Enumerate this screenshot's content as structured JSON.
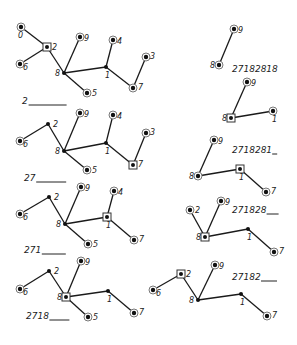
{
  "figure": {
    "graphs": [
      {
        "id": "g1",
        "sequence_label": "2",
        "blank_width": 38,
        "label_pos": [
          22,
          104
        ],
        "nodes": [
          {
            "id": "0",
            "x": 21,
            "y": 27,
            "style": "ring",
            "label_dx": -3,
            "label_dy": 11
          },
          {
            "id": "2",
            "x": 47,
            "y": 47,
            "style": "box",
            "label_dx": 5,
            "label_dy": 3
          },
          {
            "id": "6",
            "x": 20,
            "y": 64,
            "style": "ring",
            "label_dx": 3,
            "label_dy": 6
          },
          {
            "id": "8",
            "x": 64,
            "y": 73,
            "style": "dot",
            "label_dx": -9,
            "label_dy": 3
          },
          {
            "id": "9",
            "x": 80,
            "y": 37,
            "style": "ring",
            "label_dx": 4,
            "label_dy": 4
          },
          {
            "id": "4",
            "x": 113,
            "y": 40,
            "style": "ring",
            "label_dx": 4,
            "label_dy": 4
          },
          {
            "id": "1",
            "x": 106,
            "y": 67,
            "style": "dot",
            "label_dx": -1,
            "label_dy": 11
          },
          {
            "id": "3",
            "x": 146,
            "y": 57,
            "style": "ring",
            "label_dx": 4,
            "label_dy": 2
          },
          {
            "id": "7",
            "x": 133,
            "y": 88,
            "style": "ring",
            "label_dx": 5,
            "label_dy": 2
          },
          {
            "id": "5",
            "x": 87,
            "y": 93,
            "style": "ring",
            "label_dx": 5,
            "label_dy": 3
          }
        ],
        "edges": [
          [
            "0",
            "2"
          ],
          [
            "2",
            "6"
          ],
          [
            "2",
            "8"
          ],
          [
            "8",
            "9"
          ],
          [
            "8",
            "1"
          ],
          [
            "8",
            "5"
          ],
          [
            "1",
            "4"
          ],
          [
            "1",
            "7"
          ],
          [
            "7",
            "3"
          ]
        ]
      },
      {
        "id": "g2",
        "sequence_label": "27",
        "blank_width": 30,
        "label_pos": [
          24,
          181
        ],
        "nodes": [
          {
            "id": "2",
            "x": 48,
            "y": 124,
            "style": "dot",
            "label_dx": 5,
            "label_dy": 3
          },
          {
            "id": "6",
            "x": 20,
            "y": 141,
            "style": "ring",
            "label_dx": 3,
            "label_dy": 6
          },
          {
            "id": "8",
            "x": 64,
            "y": 151,
            "style": "dot",
            "label_dx": -9,
            "label_dy": 3
          },
          {
            "id": "9",
            "x": 80,
            "y": 113,
            "style": "ring",
            "label_dx": 4,
            "label_dy": 4
          },
          {
            "id": "4",
            "x": 113,
            "y": 115,
            "style": "ring",
            "label_dx": 4,
            "label_dy": 4
          },
          {
            "id": "1",
            "x": 106,
            "y": 143,
            "style": "dot",
            "label_dx": -1,
            "label_dy": 11
          },
          {
            "id": "3",
            "x": 146,
            "y": 133,
            "style": "ring",
            "label_dx": 4,
            "label_dy": 2
          },
          {
            "id": "7",
            "x": 133,
            "y": 165,
            "style": "box",
            "label_dx": 5,
            "label_dy": 2
          },
          {
            "id": "5",
            "x": 87,
            "y": 170,
            "style": "ring",
            "label_dx": 5,
            "label_dy": 3
          }
        ],
        "edges": [
          [
            "2",
            "6"
          ],
          [
            "2",
            "8"
          ],
          [
            "8",
            "9"
          ],
          [
            "8",
            "1"
          ],
          [
            "8",
            "5"
          ],
          [
            "1",
            "4"
          ],
          [
            "1",
            "7"
          ],
          [
            "7",
            "3"
          ]
        ]
      },
      {
        "id": "g3",
        "sequence_label": "271",
        "blank_width": 24,
        "label_pos": [
          24,
          253
        ],
        "nodes": [
          {
            "id": "2",
            "x": 49,
            "y": 197,
            "style": "dot",
            "label_dx": 5,
            "label_dy": 3
          },
          {
            "id": "6",
            "x": 20,
            "y": 214,
            "style": "ring",
            "label_dx": 3,
            "label_dy": 6
          },
          {
            "id": "8",
            "x": 65,
            "y": 224,
            "style": "dot",
            "label_dx": -9,
            "label_dy": 3
          },
          {
            "id": "9",
            "x": 81,
            "y": 187,
            "style": "ring",
            "label_dx": 4,
            "label_dy": 4
          },
          {
            "id": "4",
            "x": 114,
            "y": 191,
            "style": "ring",
            "label_dx": 4,
            "label_dy": 4
          },
          {
            "id": "1",
            "x": 107,
            "y": 217,
            "style": "box",
            "label_dx": -1,
            "label_dy": 11
          },
          {
            "id": "7",
            "x": 134,
            "y": 240,
            "style": "ring",
            "label_dx": 5,
            "label_dy": 2
          },
          {
            "id": "5",
            "x": 88,
            "y": 244,
            "style": "ring",
            "label_dx": 5,
            "label_dy": 3
          }
        ],
        "edges": [
          [
            "2",
            "6"
          ],
          [
            "2",
            "8"
          ],
          [
            "8",
            "9"
          ],
          [
            "8",
            "1"
          ],
          [
            "8",
            "5"
          ],
          [
            "1",
            "4"
          ],
          [
            "1",
            "7"
          ]
        ]
      },
      {
        "id": "g4",
        "sequence_label": "2718",
        "blank_width": 20,
        "label_pos": [
          26,
          319
        ],
        "nodes": [
          {
            "id": "2",
            "x": 49,
            "y": 271,
            "style": "dot",
            "label_dx": 5,
            "label_dy": 3
          },
          {
            "id": "6",
            "x": 20,
            "y": 289,
            "style": "ring",
            "label_dx": 3,
            "label_dy": 6
          },
          {
            "id": "8",
            "x": 66,
            "y": 297,
            "style": "box",
            "label_dx": -9,
            "label_dy": 3
          },
          {
            "id": "9",
            "x": 81,
            "y": 261,
            "style": "ring",
            "label_dx": 4,
            "label_dy": 4
          },
          {
            "id": "1",
            "x": 108,
            "y": 291,
            "style": "dot",
            "label_dx": -1,
            "label_dy": 11
          },
          {
            "id": "7",
            "x": 134,
            "y": 313,
            "style": "ring",
            "label_dx": 5,
            "label_dy": 2
          },
          {
            "id": "5",
            "x": 88,
            "y": 317,
            "style": "ring",
            "label_dx": 5,
            "label_dy": 3
          }
        ],
        "edges": [
          [
            "2",
            "6"
          ],
          [
            "2",
            "8"
          ],
          [
            "8",
            "9"
          ],
          [
            "8",
            "1"
          ],
          [
            "8",
            "5"
          ],
          [
            "1",
            "7"
          ]
        ]
      },
      {
        "id": "g5",
        "sequence_label": "27182818",
        "blank_width": 0,
        "label_pos": [
          232,
          72
        ],
        "nodes": [
          {
            "id": "9",
            "x": 234,
            "y": 29,
            "style": "ring",
            "label_dx": 4,
            "label_dy": 4
          },
          {
            "id": "8",
            "x": 219,
            "y": 65,
            "style": "ring",
            "label_dx": -9,
            "label_dy": 3
          }
        ],
        "edges": [
          [
            "8",
            "9"
          ]
        ]
      },
      {
        "id": "g6",
        "sequence_label": "",
        "blank_width": 0,
        "label_pos": [
          0,
          0
        ],
        "nodes": [
          {
            "id": "9",
            "x": 247,
            "y": 82,
            "style": "ring",
            "label_dx": 4,
            "label_dy": 4
          },
          {
            "id": "8",
            "x": 231,
            "y": 118,
            "style": "box",
            "label_dx": -9,
            "label_dy": 3
          },
          {
            "id": "1",
            "x": 273,
            "y": 111,
            "style": "ring",
            "label_dx": -1,
            "label_dy": 11
          }
        ],
        "edges": [
          [
            "8",
            "9"
          ],
          [
            "8",
            "1"
          ]
        ]
      },
      {
        "id": "g7",
        "sequence_label": "2718281",
        "blank_width": 5,
        "label_pos": [
          232,
          153
        ],
        "nodes": [
          {
            "id": "9",
            "x": 214,
            "y": 140,
            "style": "ring",
            "label_dx": 4,
            "label_dy": 4
          },
          {
            "id": "8",
            "x": 198,
            "y": 176,
            "style": "ring",
            "label_dx": -9,
            "label_dy": 3
          },
          {
            "id": "1",
            "x": 240,
            "y": 169,
            "style": "box",
            "label_dx": -1,
            "label_dy": 11
          },
          {
            "id": "7",
            "x": 266,
            "y": 192,
            "style": "ring",
            "label_dx": 5,
            "label_dy": 2
          }
        ],
        "edges": [
          [
            "8",
            "9"
          ],
          [
            "8",
            "1"
          ],
          [
            "1",
            "7"
          ]
        ]
      },
      {
        "id": "g8",
        "sequence_label": "271828",
        "blank_width": 12,
        "label_pos": [
          232,
          213
        ],
        "nodes": [
          {
            "id": "2",
            "x": 190,
            "y": 210,
            "style": "ring",
            "label_dx": 5,
            "label_dy": 3
          },
          {
            "id": "9",
            "x": 221,
            "y": 201,
            "style": "ring",
            "label_dx": 4,
            "label_dy": 4
          },
          {
            "id": "8",
            "x": 205,
            "y": 237,
            "style": "box",
            "label_dx": -9,
            "label_dy": 3
          },
          {
            "id": "1",
            "x": 248,
            "y": 229,
            "style": "dot",
            "label_dx": -1,
            "label_dy": 11
          },
          {
            "id": "7",
            "x": 274,
            "y": 252,
            "style": "ring",
            "label_dx": 5,
            "label_dy": 2
          }
        ],
        "edges": [
          [
            "2",
            "8"
          ],
          [
            "8",
            "9"
          ],
          [
            "8",
            "1"
          ],
          [
            "1",
            "7"
          ]
        ]
      },
      {
        "id": "g9",
        "sequence_label": "27182",
        "blank_width": 16,
        "label_pos": [
          232,
          280
        ],
        "nodes": [
          {
            "id": "2",
            "x": 181,
            "y": 274,
            "style": "box",
            "label_dx": 5,
            "label_dy": 3
          },
          {
            "id": "6",
            "x": 153,
            "y": 290,
            "style": "ring",
            "label_dx": 3,
            "label_dy": 6
          },
          {
            "id": "9",
            "x": 215,
            "y": 265,
            "style": "ring",
            "label_dx": 4,
            "label_dy": 4
          },
          {
            "id": "8",
            "x": 198,
            "y": 300,
            "style": "dot",
            "label_dx": -9,
            "label_dy": 3
          },
          {
            "id": "1",
            "x": 241,
            "y": 294,
            "style": "dot",
            "label_dx": -1,
            "label_dy": 11
          },
          {
            "id": "7",
            "x": 267,
            "y": 316,
            "style": "ring",
            "label_dx": 5,
            "label_dy": 2
          }
        ],
        "edges": [
          [
            "2",
            "6"
          ],
          [
            "2",
            "8"
          ],
          [
            "8",
            "9"
          ],
          [
            "8",
            "1"
          ],
          [
            "1",
            "7"
          ]
        ]
      }
    ]
  }
}
